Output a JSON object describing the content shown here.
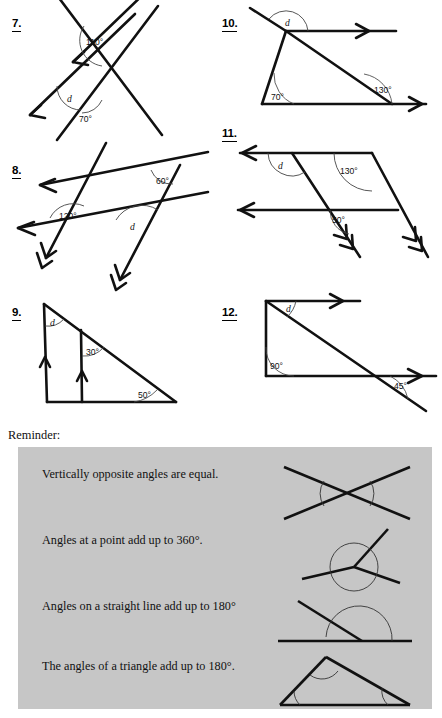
{
  "worksheet": {
    "reminder_label": "Reminder:",
    "unknown_symbol": "d",
    "degree": "°"
  },
  "problems": [
    {
      "number": "7.",
      "type": "two-parallel-lines-cut-by-transversal",
      "angles": [
        "110°",
        "d",
        "70°"
      ],
      "known": [
        "110°",
        "70°"
      ],
      "unknown": "d",
      "arrow_marks": "single",
      "column": "left"
    },
    {
      "number": "8.",
      "type": "parallelogram-grid-two-pairs-parallel",
      "angles": [
        "120°",
        "60°",
        "d"
      ],
      "known": [
        "120°",
        "60°"
      ],
      "unknown": "d",
      "arrow_marks": "single-and-double",
      "column": "left"
    },
    {
      "number": "9.",
      "type": "triangle-with-internal-parallel-line",
      "angles": [
        "d",
        "30°",
        "50°"
      ],
      "known": [
        "30°",
        "50°"
      ],
      "unknown": "d",
      "arrow_marks": "single-upward",
      "column": "left"
    },
    {
      "number": "10.",
      "type": "triangle-with-parallel-lines-and-exterior-angle",
      "angles": [
        "d",
        "70°",
        "130°"
      ],
      "known": [
        "70°",
        "130°"
      ],
      "unknown": "d",
      "arrow_marks": "single-right",
      "column": "right"
    },
    {
      "number": "11.",
      "type": "parallelogram-two-pairs-parallel",
      "angles": [
        "d",
        "130°",
        "50°"
      ],
      "known": [
        "130°",
        "50°"
      ],
      "unknown": "d",
      "arrow_marks": "single-and-double",
      "column": "right"
    },
    {
      "number": "12.",
      "type": "right-triangle-with-parallel-lines",
      "angles": [
        "d",
        "90°",
        "45°"
      ],
      "known": [
        "90°",
        "45°"
      ],
      "unknown": "d",
      "arrow_marks": "single-right",
      "column": "right"
    }
  ],
  "reminder": {
    "background_color": "#c6c6c6",
    "rules": [
      {
        "text": "Vertically opposite angles are equal.",
        "figure": "crossed-lines-vertically-opposite"
      },
      {
        "text": "Angles at a point add up to 360°.",
        "figure": "rays-from-point-full-turn"
      },
      {
        "text": "Angles on a straight line add up to 180°",
        "figure": "straight-line-with-ray"
      },
      {
        "text": "The angles of a triangle add up to 180°.",
        "figure": "triangle-three-angles"
      }
    ]
  },
  "labels": {
    "q7_a1": "110°",
    "q7_a2": "d",
    "q7_a3": "70°",
    "q8_a1": "120°",
    "q8_a2": "60°",
    "q8_a3": "d",
    "q9_a1": "d",
    "q9_a2": "30°",
    "q9_a3": "50°",
    "q10_a1": "d",
    "q10_a2": "70°",
    "q10_a3": "130°",
    "q11_a1": "d",
    "q11_a2": "130°",
    "q11_a3": "50°",
    "q12_a1": "d",
    "q12_a2": "90°",
    "q12_a3": "45°"
  }
}
